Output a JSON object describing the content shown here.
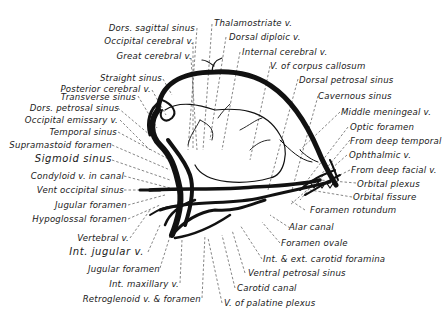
{
  "figure": {
    "colors": {
      "ink": "#111111",
      "background": "#ffffff",
      "leader": "#333333"
    }
  },
  "labels": {
    "top": [
      {
        "id": "dors-sagittal-sinus",
        "text": "Dors. sagittal sinus"
      },
      {
        "id": "occipital-cerebral-v",
        "text": "Occipital cerebral v."
      },
      {
        "id": "great-cerebral-v",
        "text": "Great cerebral v."
      },
      {
        "id": "thalamostriate-v",
        "text": "Thalamostriate v."
      },
      {
        "id": "dorsal-diploic-v",
        "text": "Dorsal diploic v."
      },
      {
        "id": "internal-cerebral-v",
        "text": "Internal cerebral v."
      },
      {
        "id": "v-of-corpus-callosum",
        "text": "V. of corpus callosum"
      },
      {
        "id": "dorsal-petrosal-sinus",
        "text": "Dorsal petrosal sinus"
      },
      {
        "id": "cavernous-sinus",
        "text": "Cavernous sinus"
      }
    ],
    "left": [
      {
        "id": "straight-sinus",
        "text": "Straight sinus"
      },
      {
        "id": "posterior-cerebral-v",
        "text": "Posterior cerebral v."
      },
      {
        "id": "transverse-sinus",
        "text": "Transverse sinus"
      },
      {
        "id": "dors-petrosal-sinus",
        "text": "Dors. petrosal sinus"
      },
      {
        "id": "occipital-emissary-v",
        "text": "Occipital emissary v."
      },
      {
        "id": "temporal-sinus",
        "text": "Temporal sinus"
      },
      {
        "id": "supramastoid-foramen",
        "text": "Supramastoid foramen"
      },
      {
        "id": "sigmoid-sinus",
        "text": "Sigmoid sinus"
      },
      {
        "id": "condyloid-v-in-canal",
        "text": "Condyloid v. in canal"
      },
      {
        "id": "vent-occipital-sinus",
        "text": "Vent occipital sinus"
      },
      {
        "id": "jugular-foramen-1",
        "text": "Jugular foramen"
      },
      {
        "id": "hypoglossal-foramen",
        "text": "Hypoglossal foramen"
      },
      {
        "id": "vertebral-v",
        "text": "Vertebral v."
      },
      {
        "id": "int-jugular-v",
        "text": "Int. jugular v."
      },
      {
        "id": "jugular-foramen-2",
        "text": "Jugular foramen"
      },
      {
        "id": "int-maxillary-v",
        "text": "Int. maxillary v."
      },
      {
        "id": "retroglenoid-v-foramen",
        "text": "Retroglenoid v. & foramen"
      }
    ],
    "right": [
      {
        "id": "middle-meningeal-v",
        "text": "Middle meningeal v."
      },
      {
        "id": "optic-foramen",
        "text": "Optic foramen"
      },
      {
        "id": "from-deep-temporal",
        "text": "From deep temporal"
      },
      {
        "id": "ophthalmic-v",
        "text": "Ophthalmic v."
      },
      {
        "id": "from-deep-facial-v",
        "text": "From deep facial v."
      },
      {
        "id": "orbital-plexus",
        "text": "Orbital plexus"
      },
      {
        "id": "orbital-fissure",
        "text": "Orbital fissure"
      },
      {
        "id": "foramen-rotundum",
        "text": "Foramen rotundum"
      },
      {
        "id": "alar-canal",
        "text": "Alar canal"
      },
      {
        "id": "foramen-ovale",
        "text": "Foramen ovale"
      },
      {
        "id": "int-ext-carotid-foramina",
        "text": "Int. & ext. carotid foramina"
      },
      {
        "id": "ventral-petrosal-sinus",
        "text": "Ventral petrosal sinus"
      },
      {
        "id": "carotid-canal",
        "text": "Carotid canal"
      },
      {
        "id": "v-of-palatine-plexus",
        "text": "V. of palatine plexus"
      }
    ]
  }
}
